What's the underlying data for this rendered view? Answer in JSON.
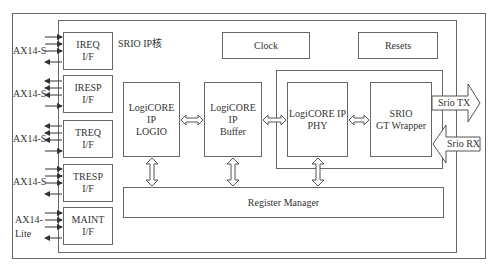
{
  "diagram": {
    "core_title": "SRIO  IP核",
    "clock_label": "Clock",
    "resets_label": "Resets",
    "register_manager_label": "Register  Manager",
    "interfaces": [
      {
        "name": "IREQ",
        "sub": "I/F",
        "bus": "AX14-S"
      },
      {
        "name": "IRESP",
        "sub": "I/F",
        "bus": "AX14-S"
      },
      {
        "name": "TREQ",
        "sub": "I/F",
        "bus": "AX14-S"
      },
      {
        "name": "TRESP",
        "sub": "I/F",
        "bus": "AX14-S"
      },
      {
        "name": "MAINT",
        "sub": "I/F",
        "bus_line1": "AX14-",
        "bus_line2": "Lite"
      }
    ],
    "blocks": [
      {
        "line1": "LogiCORE IP",
        "line2": "LOGIO"
      },
      {
        "line1": "LogiCORE IP",
        "line2": "Buffer"
      },
      {
        "line1": "LogiCORE IP",
        "line2": "PHY"
      },
      {
        "line1": "SRIO",
        "line2": "GT Wrapper"
      }
    ],
    "srio_tx": "Srio  TX",
    "srio_rx": "Srio  RX"
  },
  "colors": {
    "line": "#666666",
    "background": "#ffffff",
    "text": "#333333"
  }
}
